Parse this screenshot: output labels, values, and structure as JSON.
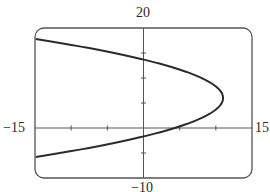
{
  "chart_data": {
    "type": "line",
    "title": "",
    "xlabel": "",
    "ylabel": "",
    "xlim": [
      -15,
      15
    ],
    "ylim": [
      -10,
      20
    ],
    "x_ticks": [
      -10,
      -5,
      0,
      5,
      10
    ],
    "y_ticks": [
      -5,
      5,
      10,
      15
    ],
    "grid": false,
    "legend": null,
    "series": [
      {
        "name": "parabola opening left (x = 11 - 0.186(y - 6)^2)",
        "points": [
          [
            -15,
            17.8
          ],
          [
            -12,
            17.1
          ],
          [
            -9,
            16.4
          ],
          [
            -6,
            15.6
          ],
          [
            -3,
            14.7
          ],
          [
            0,
            13.7
          ],
          [
            2,
            12.9
          ],
          [
            4,
            12.1
          ],
          [
            6,
            11.2
          ],
          [
            8,
            10.0
          ],
          [
            9.5,
            8.8
          ],
          [
            10.5,
            7.5
          ],
          [
            11,
            6.0
          ],
          [
            10.5,
            4.5
          ],
          [
            9.5,
            3.2
          ],
          [
            8,
            2.0
          ],
          [
            6,
            0.8
          ],
          [
            4.3,
            0
          ],
          [
            2,
            -0.9
          ],
          [
            0,
            -1.7
          ],
          [
            -3,
            -2.7
          ],
          [
            -6,
            -3.6
          ],
          [
            -9,
            -4.4
          ],
          [
            -12,
            -5.1
          ],
          [
            -15,
            -5.8
          ]
        ]
      }
    ],
    "axis_labels": {
      "x_min": "−15",
      "x_max": "15",
      "y_max": "20",
      "y_min": "−10"
    }
  },
  "colors": {
    "frame": "#555555",
    "curve": "#2b2b2b",
    "text": "#2a2a2a"
  }
}
